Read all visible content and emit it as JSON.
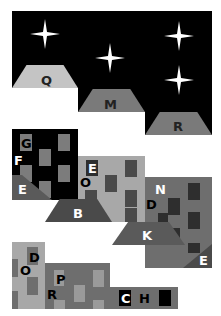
{
  "colors": {
    "night": "#000000",
    "roof_light": "#c4c4c4",
    "roof_mid": "#7a7a7a",
    "roof_dark": "#5a5a5a",
    "building_black": "#000000",
    "building_light": "#a8a8a8",
    "building_mid": "#6e6e6e",
    "window_gray": "#7c7c7c",
    "window_dark": "#2e2e2e",
    "white": "#ffffff"
  },
  "top_scene": {
    "roofs": [
      {
        "label": "Q"
      },
      {
        "label": "M"
      },
      {
        "label": "R"
      }
    ],
    "star_count": 4
  },
  "middle_scene": {
    "building_1": {
      "letters": [
        "G",
        "F",
        "E"
      ]
    },
    "building_2": {
      "letters": [
        "E",
        "O",
        "B"
      ]
    },
    "building_3": {
      "letters": [
        "N",
        "D",
        "K",
        "E"
      ]
    }
  },
  "bottom_scene": {
    "building_1": {
      "letters": [
        "D",
        "O"
      ]
    },
    "building_2": {
      "letters": [
        "P",
        "R"
      ]
    },
    "building_3": {
      "letters": [
        "C",
        "H"
      ]
    }
  }
}
